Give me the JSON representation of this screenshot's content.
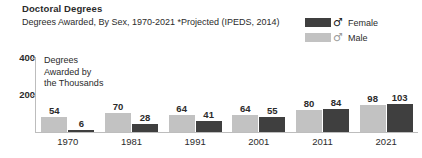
{
  "header": {
    "title": "Doctoral Degrees",
    "subtitle": "Degrees Awarded, By Sex, 1970-2021 *Projected (IPEDS, 2014)"
  },
  "legend": {
    "position": "top-right",
    "entries": [
      {
        "label": "Female",
        "symbol": "♂",
        "symbol_name": "mars-symbol",
        "color": "#3f3f3f"
      },
      {
        "label": "Male",
        "symbol": "♂",
        "symbol_name": "mars-symbol",
        "color": "#c2c2c2"
      }
    ]
  },
  "axis_caption": "Degrees\nAwarded by\nthe Thousands",
  "chart_data": {
    "type": "bar",
    "title": "Doctoral Degrees",
    "subtitle": "Degrees Awarded, By Sex, 1970-2021 *Projected (IPEDS, 2014)",
    "xlabel": "",
    "ylabel": "Degrees Awarded by the Thousands",
    "categories": [
      "1970",
      "1981",
      "1991",
      "2001",
      "2011",
      "2021"
    ],
    "series": [
      {
        "name": "Male",
        "color": "#c2c2c2",
        "values": [
          54,
          70,
          64,
          64,
          80,
          98
        ]
      },
      {
        "name": "Female",
        "color": "#3f3f3f",
        "values": [
          6,
          28,
          41,
          55,
          84,
          103
        ]
      }
    ],
    "ylim": [
      0,
      400
    ],
    "yticks": [
      400,
      200
    ],
    "ytick_labels": [
      "400",
      "200"
    ],
    "grid": false,
    "legend_position": "top-right",
    "data_labels": true
  },
  "colors": {
    "female": "#3f3f3f",
    "male": "#c2c2c2",
    "axis": "#bdbdbd",
    "text": "#2b2b2b",
    "background": "#ffffff"
  }
}
